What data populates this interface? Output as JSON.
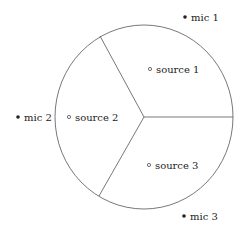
{
  "diagram": {
    "type": "partitioned-circle",
    "sectors": 3,
    "colors": {
      "stroke": "#555555",
      "text": "#222222",
      "fill": "#ffffff"
    },
    "microphones": [
      {
        "label": "mic 1",
        "marker": "filled-dot"
      },
      {
        "label": "mic 2",
        "marker": "filled-dot"
      },
      {
        "label": "mic 3",
        "marker": "filled-dot"
      }
    ],
    "sources": [
      {
        "label": "source 1",
        "marker": "hollow-circle"
      },
      {
        "label": "source 2",
        "marker": "hollow-circle"
      },
      {
        "label": "source 3",
        "marker": "hollow-circle"
      }
    ]
  }
}
